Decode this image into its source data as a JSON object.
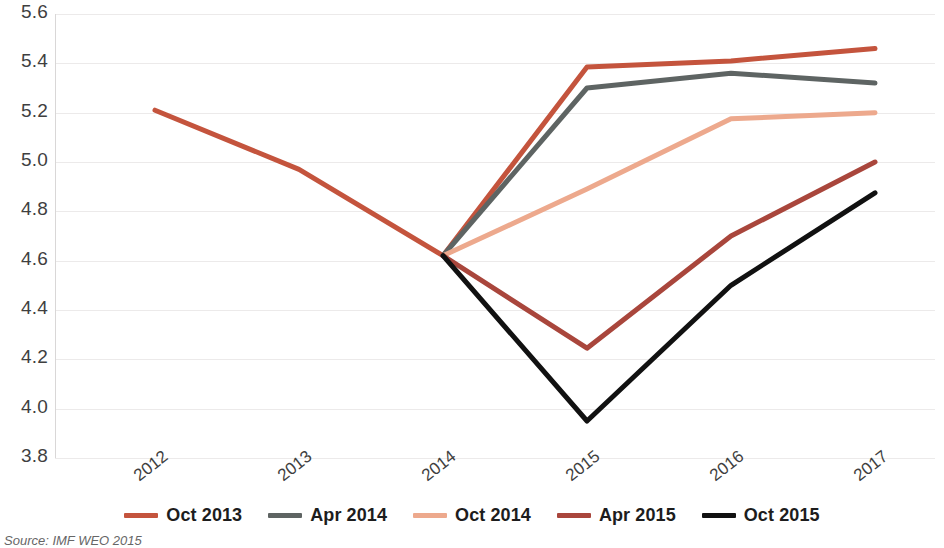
{
  "chart_data": {
    "type": "line",
    "title": "",
    "subtitle": "",
    "xlabel": "",
    "ylabel": "",
    "categories": [
      "2012",
      "2013",
      "2014",
      "2015",
      "2016",
      "2017"
    ],
    "ylim": [
      3.8,
      5.6
    ],
    "yticks": [
      "3.8",
      "4.0",
      "4.2",
      "4.4",
      "4.6",
      "4.8",
      "5.0",
      "5.2",
      "5.4",
      "5.6"
    ],
    "grid": true,
    "legend_position": "bottom",
    "series": [
      {
        "name": "Oct 2013",
        "color": "#c4543d",
        "x": [
          "2012",
          "2013",
          "2014",
          "2015",
          "2016",
          "2017"
        ],
        "values": [
          5.21,
          4.97,
          4.62,
          5.385,
          5.41,
          5.46
        ]
      },
      {
        "name": "Apr 2014",
        "color": "#5e6463",
        "x": [
          "2014",
          "2015",
          "2016",
          "2017"
        ],
        "values": [
          4.62,
          5.3,
          5.36,
          5.32
        ]
      },
      {
        "name": "Oct 2014",
        "color": "#eda98d",
        "x": [
          "2014",
          "2015",
          "2016",
          "2017"
        ],
        "values": [
          4.62,
          4.89,
          5.175,
          5.2
        ]
      },
      {
        "name": "Apr 2015",
        "color": "#a9463c",
        "x": [
          "2014",
          "2015",
          "2016",
          "2017"
        ],
        "values": [
          4.62,
          4.245,
          4.7,
          5.0
        ]
      },
      {
        "name": "Oct 2015",
        "color": "#111111",
        "x": [
          "2014",
          "2015",
          "2016",
          "2017"
        ],
        "values": [
          4.62,
          3.95,
          4.5,
          4.875
        ]
      }
    ]
  },
  "axis": {
    "y_ticks": [
      "5.6",
      "5.4",
      "5.2",
      "5.0",
      "4.8",
      "4.6",
      "4.4",
      "4.2",
      "4.0",
      "3.8"
    ],
    "x_ticks": [
      "2012",
      "2013",
      "2014",
      "2015",
      "2016",
      "2017"
    ]
  },
  "legend": {
    "items": [
      {
        "label": "Oct 2013",
        "color": "#c4543d"
      },
      {
        "label": "Apr 2014",
        "color": "#5e6463"
      },
      {
        "label": "Oct 2014",
        "color": "#eda98d"
      },
      {
        "label": "Apr 2015",
        "color": "#a9463c"
      },
      {
        "label": "Oct 2015",
        "color": "#111111"
      }
    ]
  },
  "footer": {
    "source": "Source: IMF WEO 2015"
  }
}
